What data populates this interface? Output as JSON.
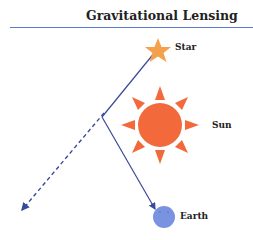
{
  "title": "Gravitational Lensing",
  "labels": {
    "star": "Star",
    "sun": "Sun",
    "earth": "Earth"
  },
  "colors": {
    "rule": "#5b7cc4",
    "star": "#f5a04a",
    "sun": "#f26a3c",
    "earth": "#7a93e0",
    "ray": "#3a4a9a"
  }
}
